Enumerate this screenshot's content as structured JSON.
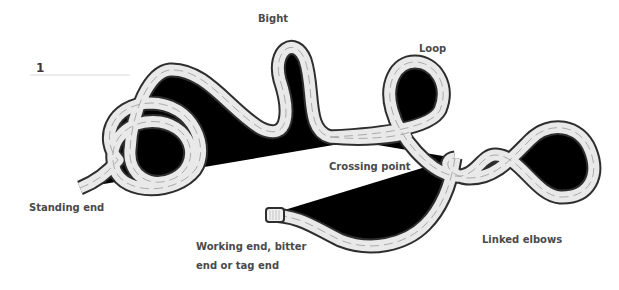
{
  "diagram": {
    "title_number": "1",
    "labels": {
      "bight": "Bight",
      "loop": "Loop",
      "crossing_point": "Crossing point",
      "standing_end": "Standing end",
      "linked_elbows": "Linked elbows",
      "working_end_line1": "Working end, bitter",
      "working_end_line2": "end or tag end"
    },
    "colors": {
      "rope_outline": "#2e2e2e",
      "rope_fill": "#e9e9e9",
      "weave": "#9a9a9a",
      "label_text": "#4a4a4a",
      "leader_line": "#d8d8d8"
    }
  }
}
